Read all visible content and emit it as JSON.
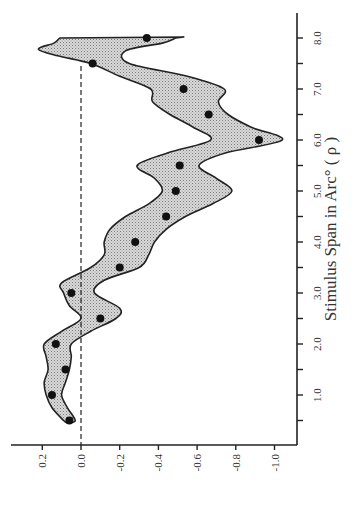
{
  "chart_data": {
    "type": "scatter",
    "orientation": "rotated-90-clockwise",
    "title": "",
    "xlabel": "Stimulus Span in Arc° ( ρ )",
    "ylabel": "",
    "xlim": [
      0.2,
      8.45
    ],
    "ylim": [
      0.3,
      -1.15
    ],
    "x_ticks": [
      1.0,
      2.0,
      3.0,
      4.0,
      5.0,
      6.0,
      7.0,
      8.0
    ],
    "x_tick_labels": [
      "1.0",
      "2.0",
      "3.0",
      "4.0",
      "5.0",
      "6.0",
      "7.0",
      "8.0"
    ],
    "x_minor_ticks": [
      0.5,
      1.5,
      2.5,
      3.5,
      4.5,
      5.5,
      6.5,
      7.5
    ],
    "y_ticks": [
      0.2,
      0.0,
      -0.2,
      -0.4,
      -0.6,
      -0.8,
      -1.0
    ],
    "y_tick_labels": [
      "0.2",
      "0.0",
      "-0.2",
      "-0.4",
      "-0.6",
      "-0.8",
      "-1.0"
    ],
    "reference_line": {
      "y": 0.0,
      "style": "dashed",
      "x_range": [
        0.2,
        7.45
      ]
    },
    "grid": false,
    "legend": "none",
    "series": [
      {
        "name": "data points",
        "marker": "filled-circle",
        "x": [
          0.5,
          1.0,
          1.5,
          2.0,
          2.5,
          3.0,
          3.5,
          4.0,
          4.5,
          5.0,
          5.5,
          6.0,
          6.5,
          7.0,
          7.5,
          8.0
        ],
        "y": [
          0.06,
          0.15,
          0.08,
          0.13,
          -0.1,
          0.05,
          -0.2,
          -0.28,
          -0.44,
          -0.49,
          -0.51,
          -0.92,
          -0.66,
          -0.53,
          -0.06,
          -0.34
        ]
      }
    ],
    "band": {
      "name": "confidence band",
      "fill": "stippled-gray",
      "upper": [
        [
          0.45,
          0.07
        ],
        [
          0.5,
          0.09
        ],
        [
          0.75,
          0.15
        ],
        [
          1.0,
          0.18
        ],
        [
          1.25,
          0.19
        ],
        [
          1.5,
          0.17
        ],
        [
          1.75,
          0.18
        ],
        [
          2.0,
          0.19
        ],
        [
          2.25,
          0.1
        ],
        [
          2.5,
          0.0
        ],
        [
          2.75,
          0.06
        ],
        [
          3.0,
          0.09
        ],
        [
          3.2,
          0.1
        ],
        [
          3.5,
          -0.05
        ],
        [
          3.75,
          -0.12
        ],
        [
          4.0,
          -0.12
        ],
        [
          4.25,
          -0.15
        ],
        [
          4.5,
          -0.23
        ],
        [
          4.75,
          -0.35
        ],
        [
          5.0,
          -0.42
        ],
        [
          5.25,
          -0.38
        ],
        [
          5.5,
          -0.29
        ],
        [
          5.75,
          -0.45
        ],
        [
          6.0,
          -0.67
        ],
        [
          6.25,
          -0.58
        ],
        [
          6.5,
          -0.46
        ],
        [
          6.75,
          -0.37
        ],
        [
          7.0,
          -0.36
        ],
        [
          7.25,
          -0.2
        ],
        [
          7.5,
          -0.05
        ],
        [
          7.65,
          0.12
        ],
        [
          7.78,
          0.22
        ],
        [
          7.9,
          0.14
        ],
        [
          8.0,
          0.11
        ]
      ],
      "lower": [
        [
          0.45,
          0.07
        ],
        [
          0.5,
          0.03
        ],
        [
          0.75,
          0.07
        ],
        [
          1.0,
          0.1
        ],
        [
          1.25,
          0.08
        ],
        [
          1.5,
          0.06
        ],
        [
          1.75,
          0.05
        ],
        [
          2.0,
          0.05
        ],
        [
          2.25,
          -0.05
        ],
        [
          2.5,
          -0.18
        ],
        [
          2.7,
          -0.2
        ],
        [
          3.0,
          -0.07
        ],
        [
          3.25,
          -0.12
        ],
        [
          3.5,
          -0.3
        ],
        [
          3.75,
          -0.35
        ],
        [
          4.0,
          -0.38
        ],
        [
          4.25,
          -0.44
        ],
        [
          4.5,
          -0.54
        ],
        [
          4.75,
          -0.68
        ],
        [
          5.0,
          -0.78
        ],
        [
          5.25,
          -0.7
        ],
        [
          5.5,
          -0.61
        ],
        [
          5.75,
          -0.75
        ],
        [
          6.0,
          -1.04
        ],
        [
          6.25,
          -0.88
        ],
        [
          6.5,
          -0.76
        ],
        [
          6.75,
          -0.71
        ],
        [
          7.0,
          -0.74
        ],
        [
          7.25,
          -0.55
        ],
        [
          7.5,
          -0.25
        ],
        [
          7.75,
          -0.23
        ],
        [
          7.9,
          -0.42
        ],
        [
          8.0,
          -0.49
        ]
      ]
    }
  }
}
